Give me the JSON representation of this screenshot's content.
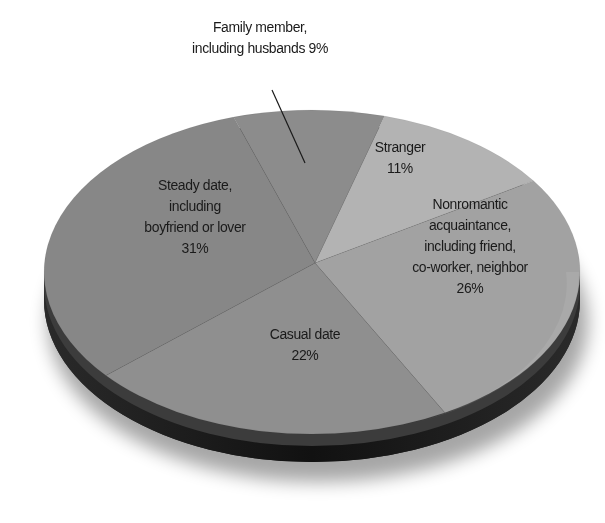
{
  "chart_data": {
    "type": "pie",
    "title": "",
    "style": "3d-tilted",
    "categories": [
      "Family member, including husbands",
      "Stranger",
      "Nonromantic acquaintance, including friend, co-worker, neighbor",
      "Casual date",
      "Steady date, including boyfriend or lover"
    ],
    "values": [
      9,
      11,
      26,
      22,
      31
    ],
    "unit": "%",
    "colors": {
      "family": "#8c8c8c",
      "stranger": "#b3b3b3",
      "nonromantic": "#a2a2a2",
      "casual": "#8f8f8f",
      "steady": "#878787",
      "rim_dark": "#1c1c1c",
      "rim_mid": "#3a3a3a"
    },
    "legend": "none",
    "annotations": [
      {
        "slice": "Family member, including husbands",
        "callout": "leader-line"
      }
    ]
  },
  "labels": {
    "family": {
      "line1": "Family member,",
      "line2": "including husbands 9%"
    },
    "stranger": {
      "line1": "Stranger",
      "line2": "11%"
    },
    "nonromantic": {
      "line1": "Nonromantic",
      "line2": "acquaintance,",
      "line3": "including friend,",
      "line4": "co-worker, neighbor",
      "line5": "26%"
    },
    "casual": {
      "line1": "Casual date",
      "line2": "22%"
    },
    "steady": {
      "line1": "Steady date,",
      "line2": "including",
      "line3": "boyfriend or lover",
      "line4": "31%"
    }
  }
}
